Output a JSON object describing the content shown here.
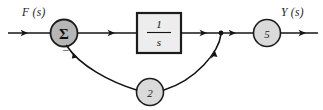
{
  "diagram": {
    "type": "control-system-block-diagram",
    "background_color": "#ffffff",
    "line_color": "#141414",
    "labels": {
      "input_signal": "F (s)",
      "output_signal": "Y (s)",
      "summing_symbol": "Σ",
      "summing_sign_feedback": "−"
    },
    "blocks": [
      {
        "id": "summing-junction",
        "shape": "circle",
        "label": "Σ",
        "fill_color": "#b6b6b6",
        "stroke_color": "#1c1c1c",
        "cx": 64,
        "cy": 33,
        "r": 13.5
      },
      {
        "id": "integrator-block",
        "shape": "rect",
        "numerator": "1",
        "denominator": "s",
        "label": "1/s",
        "fill_color": "#ededed",
        "stroke_color": "#1c1c1c",
        "x": 137,
        "y": 13,
        "width": 44,
        "height": 40
      },
      {
        "id": "output-gain",
        "shape": "circle",
        "label": "5",
        "value": 5,
        "fill_color": "#dadada",
        "stroke_color": "#1c1c1c",
        "cx": 267,
        "cy": 33,
        "r": 13.5
      },
      {
        "id": "feedback-gain",
        "shape": "circle",
        "label": "2",
        "value": 2,
        "fill_color": "#dadada",
        "stroke_color": "#1c1c1c",
        "cx": 150,
        "cy": 92,
        "r": 13.5
      }
    ],
    "nodes": [
      {
        "id": "takeoff-point",
        "cx": 221,
        "cy": 33,
        "r": 2.4
      }
    ],
    "signal_flow": [
      {
        "from": "input",
        "to": "summing-junction",
        "direction": "right"
      },
      {
        "from": "summing-junction",
        "to": "integrator-block",
        "direction": "right"
      },
      {
        "from": "integrator-block",
        "to": "takeoff-point",
        "direction": "right"
      },
      {
        "from": "takeoff-point",
        "to": "output-gain",
        "direction": "right"
      },
      {
        "from": "output-gain",
        "to": "output",
        "direction": "right"
      },
      {
        "from": "takeoff-point",
        "to": "feedback-gain",
        "direction": "curve-down-left"
      },
      {
        "from": "feedback-gain",
        "to": "summing-junction",
        "direction": "curve-up-left"
      }
    ]
  }
}
